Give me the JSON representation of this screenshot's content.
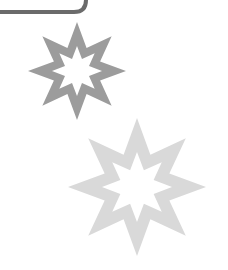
{
  "shapes": {
    "frame": {
      "label": "rounded-rectangle-corner",
      "stroke": "#6b6b6b"
    },
    "stars": [
      {
        "label": "eight-point-star-dark",
        "points": 8,
        "fill": "#9c9c9c"
      },
      {
        "label": "eight-point-star-light",
        "points": 8,
        "fill": "#d9d9d9"
      }
    ]
  }
}
